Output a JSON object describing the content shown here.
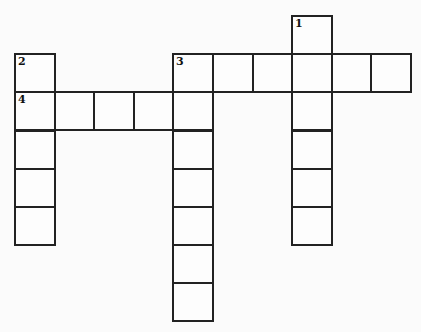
{
  "puzzle": {
    "type": "crossword",
    "origin": {
      "x": 14,
      "y": 15
    },
    "cell_w": 39.6,
    "cell_h": 38.2,
    "cells": [
      {
        "r": 0,
        "c": 7,
        "num": "1"
      },
      {
        "r": 1,
        "c": 0,
        "num": "2"
      },
      {
        "r": 1,
        "c": 4,
        "num": "3"
      },
      {
        "r": 1,
        "c": 5
      },
      {
        "r": 1,
        "c": 6
      },
      {
        "r": 1,
        "c": 7
      },
      {
        "r": 1,
        "c": 8
      },
      {
        "r": 1,
        "c": 9
      },
      {
        "r": 2,
        "c": 0,
        "num": "4"
      },
      {
        "r": 2,
        "c": 1
      },
      {
        "r": 2,
        "c": 2
      },
      {
        "r": 2,
        "c": 3
      },
      {
        "r": 2,
        "c": 4
      },
      {
        "r": 2,
        "c": 7
      },
      {
        "r": 3,
        "c": 0
      },
      {
        "r": 3,
        "c": 4
      },
      {
        "r": 3,
        "c": 7
      },
      {
        "r": 4,
        "c": 0
      },
      {
        "r": 4,
        "c": 4
      },
      {
        "r": 4,
        "c": 7
      },
      {
        "r": 5,
        "c": 0
      },
      {
        "r": 5,
        "c": 4
      },
      {
        "r": 5,
        "c": 7
      },
      {
        "r": 6,
        "c": 4
      },
      {
        "r": 7,
        "c": 4
      }
    ],
    "entries": [
      {
        "number": "1",
        "direction": "down",
        "length": 6
      },
      {
        "number": "2",
        "direction": "down",
        "length": 5
      },
      {
        "number": "3",
        "direction": "across",
        "length": 6
      },
      {
        "number": "3",
        "direction": "down",
        "length": 7
      },
      {
        "number": "4",
        "direction": "across",
        "length": 5
      }
    ]
  }
}
